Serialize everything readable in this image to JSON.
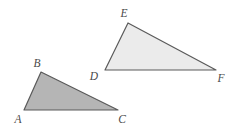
{
  "figure": {
    "background_color": "#ffffff",
    "width": 243,
    "height": 133,
    "stroke_color": "#595959",
    "label_color": "#4a4a4a"
  },
  "shapes": [
    {
      "name": "triangle-abc",
      "label": "Triangle ABC",
      "fill_color": "#b5b5b5",
      "stroke_color": "#5a5a5a",
      "stroke_width": 1.2,
      "points": "24,110 41,72 118,110",
      "vertices": [
        {
          "id": "A",
          "label": "A",
          "x": 24,
          "y": 110,
          "label_x": 18,
          "label_y": 123
        },
        {
          "id": "B",
          "label": "B",
          "x": 41,
          "y": 72,
          "label_x": 37,
          "label_y": 67
        },
        {
          "id": "C",
          "label": "C",
          "x": 118,
          "y": 110,
          "label_x": 122,
          "label_y": 123
        }
      ]
    },
    {
      "name": "triangle-def",
      "label": "Triangle DEF",
      "fill_color": "#ebebeb",
      "stroke_color": "#5a5a5a",
      "stroke_width": 1.2,
      "points": "105,70 128,23 216,70",
      "vertices": [
        {
          "id": "D",
          "label": "D",
          "x": 105,
          "y": 70,
          "label_x": 94,
          "label_y": 80
        },
        {
          "id": "E",
          "label": "E",
          "x": 128,
          "y": 23,
          "label_x": 124,
          "label_y": 17
        },
        {
          "id": "F",
          "label": "F",
          "x": 216,
          "y": 70,
          "label_x": 221,
          "label_y": 82
        }
      ]
    }
  ]
}
